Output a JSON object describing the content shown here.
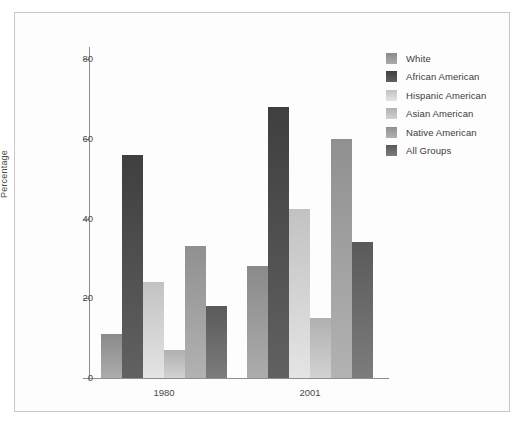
{
  "chart_data": {
    "type": "bar",
    "title": "",
    "subtitle": "",
    "xlabel": "",
    "ylabel": "Percentage",
    "categories": [
      "1980",
      "2001"
    ],
    "ylim": [
      0,
      88
    ],
    "yticks": [
      0,
      20,
      40,
      60,
      80
    ],
    "ytick_labels": [
      "0",
      "20",
      "40",
      "60",
      "80"
    ],
    "grid": false,
    "legend_position": "top-right",
    "series": [
      {
        "name": "White",
        "values": [
          11,
          28
        ],
        "color": "#8a8a8a"
      },
      {
        "name": "African American",
        "values": [
          56,
          68
        ],
        "color": "#3f3f3f"
      },
      {
        "name": "Hispanic American",
        "values": [
          24,
          42.5
        ],
        "color": "#c2c2c2"
      },
      {
        "name": "Asian American",
        "values": [
          7,
          15
        ],
        "color": "#b0b0b0"
      },
      {
        "name": "Native American",
        "values": [
          33,
          60
        ],
        "color": "#909090"
      },
      {
        "name": "All Groups",
        "values": [
          18,
          34
        ],
        "color": "#5a5a5a"
      }
    ]
  },
  "legend": {
    "items": [
      {
        "label": "White"
      },
      {
        "label": "African American"
      },
      {
        "label": "Hispanic American"
      },
      {
        "label": "Asian American"
      },
      {
        "label": "Native American"
      },
      {
        "label": "All Groups"
      }
    ]
  },
  "axes": {
    "y_title": "Percentage",
    "y_tick_labels": [
      "80",
      "60",
      "40",
      "20",
      "0"
    ],
    "x_tick_labels": [
      "1980",
      "2001"
    ]
  },
  "colors": {
    "axis": "#8d8d8d",
    "text": "#4a4a4a",
    "frame": "#c8c8c8",
    "background": "#fdfdfd"
  }
}
